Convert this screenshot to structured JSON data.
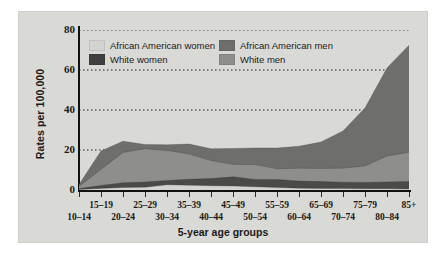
{
  "chart_data": {
    "type": "area",
    "stacked": true,
    "title": "",
    "xlabel": "5-year age groups",
    "ylabel": "Rates per 100,000",
    "ylim": [
      0,
      80
    ],
    "yticks": [
      0,
      20,
      40,
      60,
      80
    ],
    "grid": "horizontal-dotted",
    "legend_position": "top-left-inside",
    "categories": [
      "10–14",
      "15–19",
      "20–24",
      "25–29",
      "30–34",
      "35–39",
      "40–44",
      "45–49",
      "50–54",
      "55–59",
      "60–64",
      "65–69",
      "70–74",
      "75–79",
      "80–84",
      "85+"
    ],
    "series": [
      {
        "name": "African American women",
        "color": "#d3d3cf",
        "values": [
          0.3,
          0.8,
          1.2,
          1.4,
          2.6,
          2.4,
          2.1,
          2.0,
          1.6,
          1.2,
          0.9,
          0.8,
          0.7,
          0.6,
          0.6,
          0.5
        ]
      },
      {
        "name": "White women",
        "color": "#4a4a48",
        "values": [
          0.4,
          1.5,
          2.4,
          2.6,
          2.2,
          3.0,
          3.6,
          4.6,
          3.7,
          4.0,
          3.6,
          3.4,
          3.2,
          3.2,
          3.4,
          3.8
        ]
      },
      {
        "name": "White men",
        "color": "#8e8e8a",
        "values": [
          1.1,
          8.0,
          15.2,
          16.6,
          15.0,
          12.6,
          9.0,
          6.2,
          7.4,
          5.4,
          6.4,
          6.6,
          7.0,
          8.2,
          13.0,
          14.6
        ]
      },
      {
        "name": "African American men",
        "color": "#6e6e6b",
        "values": [
          0.9,
          9.2,
          5.6,
          2.2,
          2.8,
          5.0,
          5.9,
          8.0,
          8.3,
          10.4,
          11.0,
          13.2,
          18.6,
          29.0,
          44.0,
          53.5
        ]
      }
    ],
    "stack_order": [
      "African American women",
      "White women",
      "White men",
      "African American men"
    ],
    "totals": [
      2.7,
      19.5,
      24.4,
      22.8,
      22.6,
      23.0,
      20.6,
      20.8,
      21.0,
      21.0,
      21.9,
      24.0,
      29.5,
      41.0,
      61.0,
      72.4
    ]
  },
  "legend": {
    "entries": [
      {
        "label": "African American women",
        "color": "#d3d3cf",
        "swatch": "legend-swatch"
      },
      {
        "label": "African American men",
        "color": "#6e6e6b",
        "swatch": "legend-swatch"
      },
      {
        "label": "White women",
        "color": "#3f3f3d",
        "swatch": "legend-swatch"
      },
      {
        "label": "White men",
        "color": "#8e8e8a",
        "swatch": "legend-swatch"
      }
    ]
  },
  "axes": {
    "y_title": "Rates per 100,000",
    "x_title": "5-year age groups",
    "y_tick_labels": [
      "0",
      "20",
      "40",
      "60",
      "80"
    ],
    "x_tick_labels": [
      "10–14",
      "15–19",
      "20–24",
      "25–29",
      "30–34",
      "35–39",
      "40–44",
      "45–49",
      "50–54",
      "55–59",
      "60–64",
      "65–69",
      "70–74",
      "75–79",
      "80–84",
      "85+"
    ]
  },
  "colors": {
    "panel_background": "#d9d9d6",
    "page_background": "#ffffff",
    "axis": "#111111",
    "gridline": "#222222",
    "text": "#1a1a1a"
  }
}
